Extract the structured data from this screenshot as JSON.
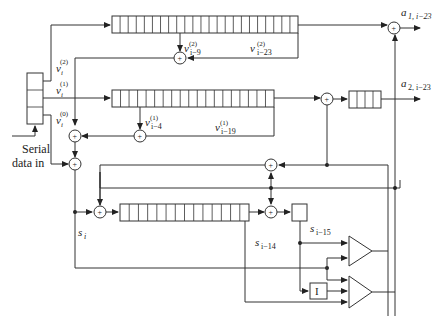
{
  "diagram": {
    "type": "shift-register encoder/decoder block diagram",
    "input": {
      "label_line1": "Serial",
      "label_line2": "data in"
    },
    "register_outputs": [
      {
        "symbol": "v",
        "sub": "i",
        "sup": "(2)"
      },
      {
        "symbol": "v",
        "sub": "i",
        "sup": "(1)"
      },
      {
        "symbol": "v",
        "sub": "i",
        "sup": "(0)"
      }
    ],
    "top_register": {
      "cells": 23,
      "taps": [
        {
          "symbol": "v",
          "sub": "i−9",
          "sup": "(2)"
        },
        {
          "symbol": "v",
          "sub": "i−23",
          "sup": "(2)"
        }
      ]
    },
    "middle_register": {
      "cells": 19,
      "taps": [
        {
          "symbol": "v",
          "sub": "i−4",
          "sup": "(1)"
        },
        {
          "symbol": "v",
          "sub": "i−19",
          "sup": "(1)"
        }
      ]
    },
    "output_register": {
      "cells": 4
    },
    "bottom_register": {
      "cells": 14
    },
    "signals": {
      "s_i": {
        "symbol": "s",
        "sub": "i"
      },
      "s_i14": {
        "symbol": "s",
        "sub": "i−14"
      },
      "s_i15": {
        "symbol": "s",
        "sub": "i−15"
      }
    },
    "outputs": [
      {
        "symbol": "a",
        "sub": "1, i−23"
      },
      {
        "symbol": "a",
        "sub": "2, i−23"
      }
    ],
    "inverter_label": "I",
    "adder_symbol": "+",
    "colors": {
      "line": "#333333",
      "background": "#ffffff"
    }
  }
}
